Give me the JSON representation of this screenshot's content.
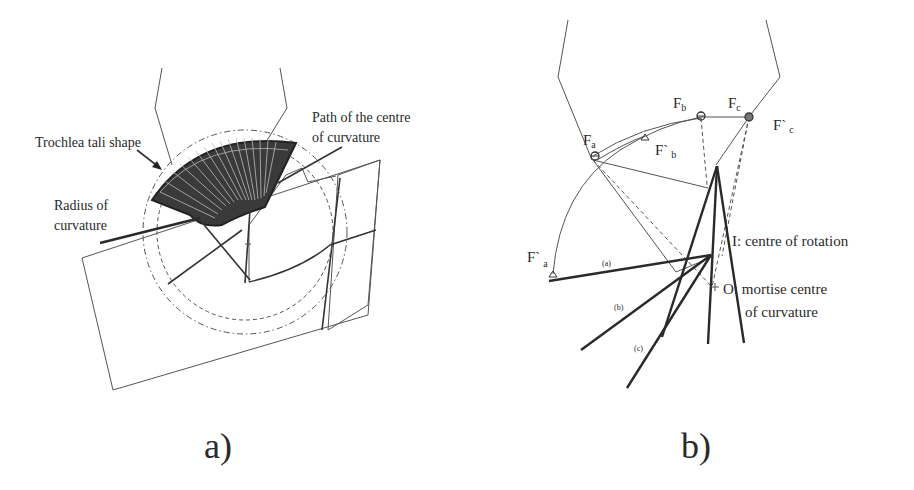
{
  "figure": {
    "panel_a": {
      "caption": "a)",
      "labels": {
        "trochlea": "Trochlea tali shape",
        "radius_line1": "Radius of",
        "radius_line2": "curvature",
        "path_line1": "Path of the centre",
        "path_line2": "of curvature"
      }
    },
    "panel_b": {
      "caption": "b)",
      "points": {
        "fa": {
          "base": "F",
          "sub": "a"
        },
        "fb": {
          "base": "F",
          "sub": "b"
        },
        "fc": {
          "base": "F",
          "sub": "c"
        },
        "fpa": {
          "base": "F`",
          "sub": "a"
        },
        "fpb": {
          "base": "F`",
          "sub": "b"
        },
        "fpc": {
          "base": "F`",
          "sub": "c"
        }
      },
      "line_labels": {
        "a": "(a)",
        "b": "(b)",
        "c": "(c)"
      },
      "labels": {
        "i_label": "I: centre of rotation",
        "o_label_line1": "O: mortise centre",
        "o_label_line2": "of curvature"
      }
    },
    "colors": {
      "ink": "#2a2a2a",
      "background": "#ffffff"
    }
  }
}
